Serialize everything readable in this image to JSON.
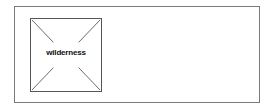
{
  "image_placeholder": {
    "alt_text": "wilderness",
    "icon": "broken-image-icon"
  },
  "colors": {
    "frame_border": "#7a7a7a",
    "image_border": "#555555",
    "cross_lines": "#666666",
    "text": "#111111"
  }
}
